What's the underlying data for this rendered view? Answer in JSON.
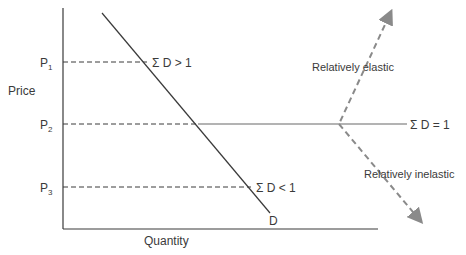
{
  "axes": {
    "y_label": "Price",
    "x_label": "Quantity"
  },
  "price_levels": [
    {
      "label": "P",
      "sub": "1",
      "y": 62
    },
    {
      "label": "P",
      "sub": "2",
      "y": 124
    },
    {
      "label": "P",
      "sub": "3",
      "y": 187
    }
  ],
  "demand_curve": {
    "label": "D",
    "annotations": [
      {
        "text": "Σ D > 1"
      },
      {
        "text": "Σ D = 1"
      },
      {
        "text": "Σ D < 1"
      }
    ]
  },
  "regions": {
    "elastic": "Relatively elastic",
    "inelastic": "Relatively inelastic"
  },
  "colors": {
    "line": "#3a3a3a",
    "grey_line": "#9a9a9a",
    "dashed_arrow": "#8a8a8a"
  }
}
